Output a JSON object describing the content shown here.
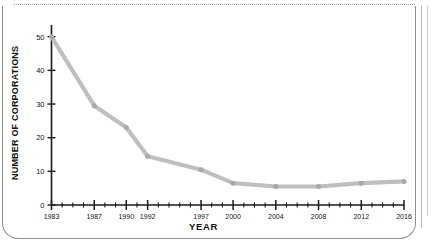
{
  "page": {
    "background": "#ffffff",
    "frame_color": "#8e8e8e",
    "artifact": "scanned-page-border"
  },
  "chart_data": {
    "type": "line",
    "title": "",
    "xlabel": "YEAR",
    "ylabel": "NUMBER OF CORPORATIONS",
    "xlim": [
      1983,
      2016
    ],
    "ylim": [
      0,
      52
    ],
    "grid": false,
    "legend": null,
    "line_color": "#bfbfbf",
    "marker_color": "#a8a8a8",
    "axis_color": "#1a1a1a",
    "ytick_labels": [
      "0",
      "10",
      "20",
      "30",
      "40",
      "50"
    ],
    "ytick_values": [
      0,
      10,
      20,
      30,
      40,
      50
    ],
    "xtick_labels": [
      "1983",
      "1987",
      "1990",
      "1992",
      "1997",
      "2000",
      "2004",
      "2008",
      "2012",
      "2016"
    ],
    "xtick_values": [
      1983,
      1987,
      1990,
      1992,
      1997,
      2000,
      2004,
      2008,
      2012,
      2016
    ],
    "x": [
      1983,
      1987,
      1990,
      1992,
      1997,
      2000,
      2004,
      2008,
      2012,
      2016
    ],
    "values": [
      50,
      29.5,
      23,
      14.5,
      10.5,
      6.5,
      5.5,
      5.5,
      6.5,
      7
    ],
    "minor_tick_interval": 1
  }
}
